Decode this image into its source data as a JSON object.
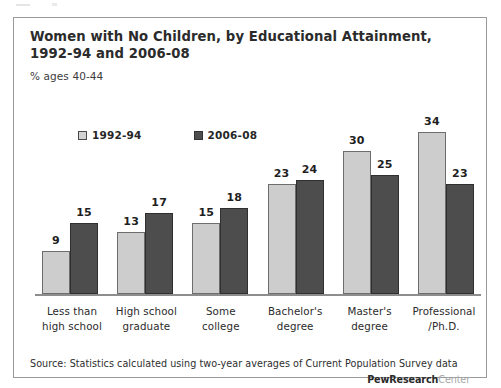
{
  "figure": {
    "title": "Women with No Children, by Educational Attainment, 1992-94 and 2006-08",
    "subtitle": "% ages 40-44",
    "source_note": "Source: Statistics calculated using two-year averages of Current Population Survey data",
    "brand_main": "PewResearch",
    "brand_sub": "Center"
  },
  "legend": {
    "items": [
      {
        "label": "1992-94",
        "swatch": "light-square-swatch",
        "color": "#d2d2d2"
      },
      {
        "label": "2006-08",
        "swatch": "dark-square-swatch",
        "color": "#4e4e4e"
      }
    ]
  },
  "chart_data": {
    "type": "bar",
    "title": "Women with No Children, by Educational Attainment, 1992-94 and 2006-08",
    "subtitle": "% ages 40-44",
    "xlabel": "",
    "ylabel": "% ages 40-44",
    "ylim": [
      0,
      36
    ],
    "grid": false,
    "legend_position": "top-left",
    "categories": [
      "Less than high school",
      "High school graduate",
      "Some college",
      "Bachelor's degree",
      "Master's degree",
      "Professional /Ph.D."
    ],
    "category_lines": [
      [
        "Less than",
        "high school"
      ],
      [
        "High school",
        "graduate"
      ],
      [
        "Some",
        "college"
      ],
      [
        "Bachelor's",
        "degree"
      ],
      [
        "Master's",
        "degree"
      ],
      [
        "Professional",
        "/Ph.D."
      ]
    ],
    "series": [
      {
        "name": "1992-94",
        "color": "#cdcdcd",
        "values": [
          9,
          13,
          15,
          23,
          30,
          34
        ]
      },
      {
        "name": "2006-08",
        "color": "#4d4d4d",
        "values": [
          15,
          17,
          18,
          24,
          25,
          23
        ]
      }
    ]
  }
}
